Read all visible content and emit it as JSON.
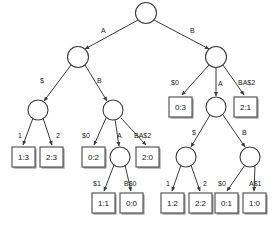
{
  "figure": {
    "type": "tree-diagram",
    "title": "",
    "colors": {
      "background": "#ffffff",
      "stroke": "#3b3b3b",
      "leaf_stroke": "#595959",
      "leaf_shadow": "#9a9a9a",
      "text": "#121212"
    }
  },
  "nodes": {
    "root": {
      "id": "n0",
      "kind": "circle",
      "cx": 146,
      "cy": 13,
      "r": 10.5,
      "label": ""
    },
    "lvl1_a": {
      "id": "n1",
      "kind": "circle",
      "cx": 78,
      "cy": 57,
      "r": 10.5,
      "label": ""
    },
    "lvl1_b": {
      "id": "n2",
      "kind": "circle",
      "cx": 216,
      "cy": 57,
      "r": 10.5,
      "label": ""
    },
    "lvl2_l1": {
      "id": "n3",
      "kind": "circle",
      "cx": 38,
      "cy": 110,
      "r": 10.0,
      "label": ""
    },
    "lvl2_l2": {
      "id": "n4",
      "kind": "circle",
      "cx": 113,
      "cy": 110,
      "r": 10.0,
      "label": ""
    },
    "lvl2_r1": {
      "id": "n5",
      "kind": "circle",
      "cx": 216,
      "cy": 107,
      "r": 10.0,
      "label": ""
    },
    "lvl3_m": {
      "id": "n6",
      "kind": "circle",
      "cx": 120,
      "cy": 157,
      "r": 10.0,
      "label": ""
    },
    "lvl3_r1": {
      "id": "n7",
      "kind": "circle",
      "cx": 186,
      "cy": 157,
      "r": 10.0,
      "label": ""
    },
    "lvl3_r2": {
      "id": "n8",
      "kind": "circle",
      "cx": 250,
      "cy": 157,
      "r": 10.0,
      "label": ""
    }
  },
  "leaves": [
    {
      "id": "l1",
      "text": "1:3",
      "x": 12,
      "y": 147,
      "w": 23,
      "h": 20
    },
    {
      "id": "l2",
      "text": "2:3",
      "x": 40,
      "y": 147,
      "w": 23,
      "h": 20
    },
    {
      "id": "l3",
      "text": "0:2",
      "x": 82,
      "y": 147,
      "w": 23,
      "h": 20
    },
    {
      "id": "l4",
      "text": "2:0",
      "x": 136,
      "y": 147,
      "w": 23,
      "h": 20
    },
    {
      "id": "l5",
      "text": "0:3",
      "x": 169,
      "y": 97,
      "w": 23,
      "h": 20
    },
    {
      "id": "l6",
      "text": "2:1",
      "x": 234,
      "y": 97,
      "w": 23,
      "h": 20
    },
    {
      "id": "l7",
      "text": "1:1",
      "x": 92,
      "y": 193,
      "w": 23,
      "h": 20
    },
    {
      "id": "l8",
      "text": "0:0",
      "x": 120,
      "y": 193,
      "w": 23,
      "h": 20
    },
    {
      "id": "l9",
      "text": "1:2",
      "x": 161,
      "y": 193,
      "w": 23,
      "h": 20
    },
    {
      "id": "l10",
      "text": "2:2",
      "x": 189,
      "y": 193,
      "w": 23,
      "h": 20
    },
    {
      "id": "l11",
      "text": "0:1",
      "x": 215,
      "y": 193,
      "w": 23,
      "h": 20
    },
    {
      "id": "l12",
      "text": "1:0",
      "x": 243,
      "y": 193,
      "w": 23,
      "h": 20
    }
  ],
  "edges": [
    {
      "from": "n0",
      "to": "n1",
      "label": "A",
      "lx": 101,
      "ly": 33,
      "x1": 138,
      "y1": 20,
      "x2": 85,
      "y2": 49
    },
    {
      "from": "n0",
      "to": "n2",
      "label": "B",
      "lx": 190,
      "ly": 33,
      "x1": 154,
      "y1": 20,
      "x2": 209,
      "y2": 49
    },
    {
      "from": "n1",
      "to": "n3",
      "label": "$",
      "lx": 40,
      "ly": 83,
      "x1": 71,
      "y1": 65,
      "x2": 44,
      "y2": 101
    },
    {
      "from": "n1",
      "to": "n4",
      "label": "B",
      "lx": 97,
      "ly": 83,
      "x1": 85,
      "y1": 65,
      "x2": 107,
      "y2": 101
    },
    {
      "from": "n2",
      "to": "l5",
      "label": "$0",
      "lx": 171,
      "ly": 85,
      "x1": 209,
      "y1": 65,
      "x2": 182,
      "y2": 95
    },
    {
      "from": "n2",
      "to": "n5",
      "label": "A",
      "lx": 218,
      "ly": 86,
      "x1": 216,
      "y1": 68,
      "x2": 216,
      "y2": 96
    },
    {
      "from": "n2",
      "to": "l6",
      "label": "BA$2",
      "lx": 238,
      "ly": 85,
      "x1": 223,
      "y1": 65,
      "x2": 244,
      "y2": 95
    },
    {
      "from": "n3",
      "to": "l1",
      "label": "1",
      "lx": 18,
      "ly": 138,
      "x1": 33,
      "y1": 118,
      "x2": 23,
      "y2": 145
    },
    {
      "from": "n3",
      "to": "l2",
      "label": "2",
      "lx": 56,
      "ly": 138,
      "x1": 43,
      "y1": 118,
      "x2": 52,
      "y2": 145
    },
    {
      "from": "n4",
      "to": "l3",
      "label": "$0",
      "lx": 82,
      "ly": 138,
      "x1": 106,
      "y1": 118,
      "x2": 94,
      "y2": 145
    },
    {
      "from": "n4",
      "to": "n6",
      "label": "A",
      "lx": 117,
      "ly": 138,
      "x1": 115,
      "y1": 119,
      "x2": 119,
      "y2": 146
    },
    {
      "from": "n4",
      "to": "l4",
      "label": "BA$2",
      "lx": 134,
      "ly": 138,
      "x1": 121,
      "y1": 118,
      "x2": 146,
      "y2": 145
    },
    {
      "from": "n5",
      "to": "n7",
      "label": "$",
      "lx": 192,
      "ly": 135,
      "x1": 210,
      "y1": 115,
      "x2": 191,
      "y2": 147
    },
    {
      "from": "n5",
      "to": "n8",
      "label": "B",
      "lx": 242,
      "ly": 135,
      "x1": 223,
      "y1": 115,
      "x2": 245,
      "y2": 147
    },
    {
      "from": "n6",
      "to": "l7",
      "label": "$1",
      "lx": 93,
      "ly": 186,
      "x1": 114,
      "y1": 165,
      "x2": 104,
      "y2": 191
    },
    {
      "from": "n6",
      "to": "l8",
      "label": "B$0",
      "lx": 124,
      "ly": 186,
      "x1": 125,
      "y1": 165,
      "x2": 131,
      "y2": 191
    },
    {
      "from": "n7",
      "to": "l9",
      "label": "1",
      "lx": 166,
      "ly": 186,
      "x1": 181,
      "y1": 165,
      "x2": 172,
      "y2": 191
    },
    {
      "from": "n7",
      "to": "l10",
      "label": "2",
      "lx": 203,
      "ly": 186,
      "x1": 191,
      "y1": 165,
      "x2": 200,
      "y2": 191
    },
    {
      "from": "n8",
      "to": "l11",
      "label": "$0",
      "lx": 218,
      "ly": 186,
      "x1": 245,
      "y1": 165,
      "x2": 227,
      "y2": 191
    },
    {
      "from": "n8",
      "to": "l12",
      "label": "A$1",
      "lx": 249,
      "ly": 186,
      "x1": 255,
      "y1": 165,
      "x2": 254,
      "y2": 191
    }
  ]
}
